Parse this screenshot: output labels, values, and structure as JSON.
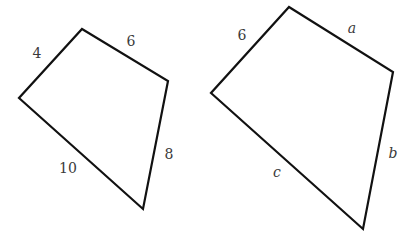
{
  "figures": [
    {
      "name": "left-quadrilateral",
      "vertices": [
        [
          82,
          29
        ],
        [
          168,
          81
        ],
        [
          143,
          209
        ],
        [
          19,
          98
        ]
      ],
      "labels": [
        {
          "text": "4",
          "x": 37,
          "y": 58,
          "italic": false
        },
        {
          "text": "6",
          "x": 131,
          "y": 46,
          "italic": false
        },
        {
          "text": "8",
          "x": 169,
          "y": 159,
          "italic": false
        },
        {
          "text": "10",
          "x": 68,
          "y": 173,
          "italic": false
        }
      ]
    },
    {
      "name": "right-quadrilateral",
      "vertices": [
        [
          289,
          7
        ],
        [
          393,
          72
        ],
        [
          363,
          229
        ],
        [
          211,
          93
        ]
      ],
      "labels": [
        {
          "text": "6",
          "x": 242,
          "y": 40,
          "italic": false
        },
        {
          "text": "a",
          "x": 352,
          "y": 33,
          "italic": true
        },
        {
          "text": "b",
          "x": 393,
          "y": 158,
          "italic": true
        },
        {
          "text": "c",
          "x": 277,
          "y": 177,
          "italic": true
        }
      ]
    }
  ],
  "style": {
    "stroke": "#111111",
    "label_color": "#3a3a3a"
  }
}
